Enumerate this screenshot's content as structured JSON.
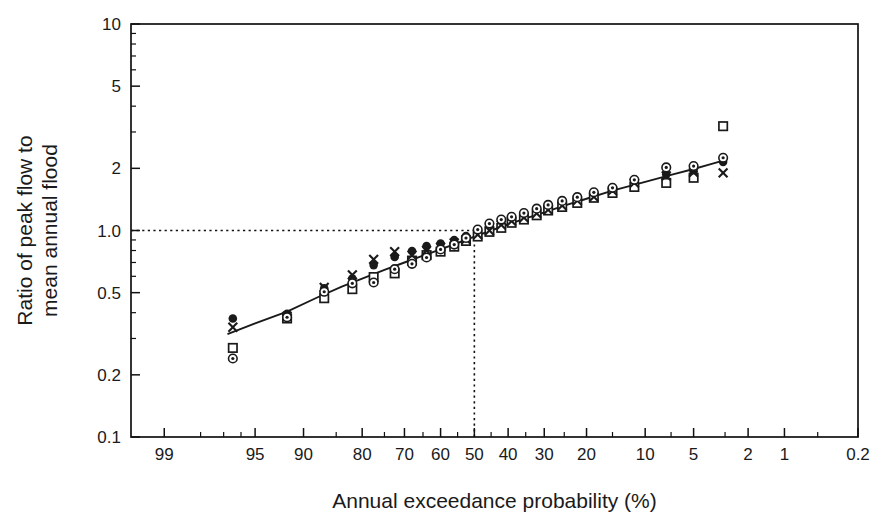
{
  "chart_data": {
    "type": "scatter",
    "title": "",
    "xlabel": "Annual exceedance probability (%)",
    "ylabel_line1": "Ratio of peak flow to",
    "ylabel_line2": "mean annual flood",
    "x_scale": "probability",
    "y_scale": "log",
    "xlim": [
      99.5,
      0.2
    ],
    "ylim": [
      0.1,
      10
    ],
    "grid": false,
    "legend": "none",
    "x_tick_labels": [
      "99",
      "95",
      "90",
      "80",
      "70",
      "60",
      "50",
      "40",
      "30",
      "20",
      "10",
      "5",
      "2",
      "1",
      "0.2"
    ],
    "x_tick_values": [
      99,
      95,
      90,
      80,
      70,
      60,
      50,
      40,
      30,
      20,
      10,
      5,
      2,
      1,
      0.2
    ],
    "x_minor_ticks": [
      98,
      97,
      96,
      85,
      75,
      65,
      55,
      45,
      35,
      25,
      15,
      7,
      3,
      0.5
    ],
    "y_tick_labels": [
      "0.1",
      "0.2",
      "0.5",
      "1.0",
      "2",
      "5",
      "10"
    ],
    "y_tick_values": [
      0.1,
      0.2,
      0.5,
      1.0,
      2,
      5,
      10
    ],
    "y_minor_ticks": [
      0.3,
      0.4,
      0.6,
      0.7,
      0.8,
      0.9,
      3,
      4,
      6,
      7,
      8,
      9
    ],
    "reference_lines": [
      {
        "name": "horizontal-ratio-one",
        "orientation": "horizontal",
        "value": 1.0,
        "style": "dotted",
        "from_x": 99.5,
        "to_x": 50
      },
      {
        "name": "vertical-fifty-percent",
        "orientation": "vertical",
        "value": 50,
        "style": "dotted",
        "from_y": 0.1,
        "to_y": 1.0
      }
    ],
    "fit_curve": {
      "name": "fitted-frequency-curve",
      "style": "solid",
      "points": [
        {
          "x": 96.8,
          "y": 0.315
        },
        {
          "x": 95.0,
          "y": 0.355
        },
        {
          "x": 92.0,
          "y": 0.405
        },
        {
          "x": 88.0,
          "y": 0.475
        },
        {
          "x": 84.0,
          "y": 0.535
        },
        {
          "x": 80.0,
          "y": 0.585
        },
        {
          "x": 75.0,
          "y": 0.645
        },
        {
          "x": 70.0,
          "y": 0.7
        },
        {
          "x": 65.0,
          "y": 0.755
        },
        {
          "x": 60.0,
          "y": 0.81
        },
        {
          "x": 55.0,
          "y": 0.87
        },
        {
          "x": 50.0,
          "y": 0.935
        },
        {
          "x": 45.0,
          "y": 1.0
        },
        {
          "x": 40.0,
          "y": 1.07
        },
        {
          "x": 35.0,
          "y": 1.145
        },
        {
          "x": 30.0,
          "y": 1.225
        },
        {
          "x": 25.0,
          "y": 1.32
        },
        {
          "x": 20.0,
          "y": 1.425
        },
        {
          "x": 15.0,
          "y": 1.56
        },
        {
          "x": 10.0,
          "y": 1.72
        },
        {
          "x": 7.0,
          "y": 1.86
        },
        {
          "x": 5.0,
          "y": 1.985
        },
        {
          "x": 3.8,
          "y": 2.095
        },
        {
          "x": 3.1,
          "y": 2.18
        }
      ]
    },
    "series": [
      {
        "name": "filled-circle-series",
        "marker": "filled-circle",
        "points": [
          {
            "x": 96.5,
            "y": 0.375
          },
          {
            "x": 92.0,
            "y": 0.395
          },
          {
            "x": 87.0,
            "y": 0.525
          },
          {
            "x": 82.0,
            "y": 0.585
          },
          {
            "x": 77.5,
            "y": 0.68
          },
          {
            "x": 72.5,
            "y": 0.745
          },
          {
            "x": 68.0,
            "y": 0.795
          },
          {
            "x": 64.0,
            "y": 0.84
          },
          {
            "x": 60.0,
            "y": 0.865
          },
          {
            "x": 56.0,
            "y": 0.9
          },
          {
            "x": 52.5,
            "y": 0.94
          },
          {
            "x": 49.0,
            "y": 0.985
          },
          {
            "x": 45.5,
            "y": 1.04
          },
          {
            "x": 42.0,
            "y": 1.085
          },
          {
            "x": 39.0,
            "y": 1.12
          },
          {
            "x": 35.5,
            "y": 1.165
          },
          {
            "x": 32.0,
            "y": 1.225
          },
          {
            "x": 29.0,
            "y": 1.27
          },
          {
            "x": 25.5,
            "y": 1.33
          },
          {
            "x": 22.0,
            "y": 1.4
          },
          {
            "x": 18.5,
            "y": 1.465
          },
          {
            "x": 15.0,
            "y": 1.545
          },
          {
            "x": 11.5,
            "y": 1.64
          },
          {
            "x": 7.5,
            "y": 1.87
          },
          {
            "x": 5.0,
            "y": 1.935
          },
          {
            "x": 3.1,
            "y": 2.15
          }
        ]
      },
      {
        "name": "open-square-series",
        "marker": "open-square",
        "points": [
          {
            "x": 96.5,
            "y": 0.27
          },
          {
            "x": 92.0,
            "y": 0.375
          },
          {
            "x": 87.0,
            "y": 0.47
          },
          {
            "x": 82.0,
            "y": 0.52
          },
          {
            "x": 77.5,
            "y": 0.595
          },
          {
            "x": 72.5,
            "y": 0.62
          },
          {
            "x": 68.0,
            "y": 0.715
          },
          {
            "x": 64.0,
            "y": 0.76
          },
          {
            "x": 60.0,
            "y": 0.79
          },
          {
            "x": 56.0,
            "y": 0.835
          },
          {
            "x": 52.5,
            "y": 0.89
          },
          {
            "x": 49.0,
            "y": 0.935
          },
          {
            "x": 45.5,
            "y": 0.985
          },
          {
            "x": 42.0,
            "y": 1.03
          },
          {
            "x": 39.0,
            "y": 1.09
          },
          {
            "x": 35.5,
            "y": 1.13
          },
          {
            "x": 32.0,
            "y": 1.185
          },
          {
            "x": 29.0,
            "y": 1.25
          },
          {
            "x": 25.5,
            "y": 1.3
          },
          {
            "x": 22.0,
            "y": 1.36
          },
          {
            "x": 18.5,
            "y": 1.44
          },
          {
            "x": 15.0,
            "y": 1.52
          },
          {
            "x": 11.5,
            "y": 1.625
          },
          {
            "x": 7.5,
            "y": 1.7
          },
          {
            "x": 5.0,
            "y": 1.8
          },
          {
            "x": 3.1,
            "y": 3.2
          }
        ]
      },
      {
        "name": "cross-series",
        "marker": "cross",
        "points": [
          {
            "x": 96.5,
            "y": 0.34
          },
          {
            "x": 92.0,
            "y": 0.385
          },
          {
            "x": 87.0,
            "y": 0.53
          },
          {
            "x": 82.0,
            "y": 0.61
          },
          {
            "x": 77.5,
            "y": 0.725
          },
          {
            "x": 72.5,
            "y": 0.79
          },
          {
            "x": 68.0,
            "y": 0.76
          },
          {
            "x": 64.0,
            "y": 0.8
          },
          {
            "x": 60.0,
            "y": 0.83
          },
          {
            "x": 56.0,
            "y": 0.87
          },
          {
            "x": 52.5,
            "y": 0.905
          },
          {
            "x": 49.0,
            "y": 0.955
          },
          {
            "x": 45.5,
            "y": 1.0
          },
          {
            "x": 42.0,
            "y": 1.065
          },
          {
            "x": 39.0,
            "y": 1.11
          },
          {
            "x": 35.5,
            "y": 1.155
          },
          {
            "x": 32.0,
            "y": 1.21
          },
          {
            "x": 29.0,
            "y": 1.26
          },
          {
            "x": 25.5,
            "y": 1.32
          },
          {
            "x": 22.0,
            "y": 1.395
          },
          {
            "x": 18.5,
            "y": 1.455
          },
          {
            "x": 15.0,
            "y": 1.56
          },
          {
            "x": 11.5,
            "y": 1.7
          },
          {
            "x": 7.5,
            "y": 1.84
          },
          {
            "x": 5.0,
            "y": 1.91
          },
          {
            "x": 3.1,
            "y": 1.9
          }
        ]
      },
      {
        "name": "dotted-circle-series",
        "marker": "circle-with-dot",
        "points": [
          {
            "x": 96.5,
            "y": 0.24
          },
          {
            "x": 92.0,
            "y": 0.38
          },
          {
            "x": 87.0,
            "y": 0.505
          },
          {
            "x": 82.0,
            "y": 0.555
          },
          {
            "x": 77.5,
            "y": 0.56
          },
          {
            "x": 72.5,
            "y": 0.65
          },
          {
            "x": 68.0,
            "y": 0.69
          },
          {
            "x": 64.0,
            "y": 0.74
          },
          {
            "x": 60.0,
            "y": 0.81
          },
          {
            "x": 56.0,
            "y": 0.855
          },
          {
            "x": 52.5,
            "y": 0.92
          },
          {
            "x": 49.0,
            "y": 1.01
          },
          {
            "x": 45.5,
            "y": 1.08
          },
          {
            "x": 42.0,
            "y": 1.13
          },
          {
            "x": 39.0,
            "y": 1.165
          },
          {
            "x": 35.5,
            "y": 1.215
          },
          {
            "x": 32.0,
            "y": 1.275
          },
          {
            "x": 29.0,
            "y": 1.33
          },
          {
            "x": 25.5,
            "y": 1.39
          },
          {
            "x": 22.0,
            "y": 1.45
          },
          {
            "x": 18.5,
            "y": 1.53
          },
          {
            "x": 15.0,
            "y": 1.61
          },
          {
            "x": 11.5,
            "y": 1.76
          },
          {
            "x": 7.5,
            "y": 2.02
          },
          {
            "x": 5.0,
            "y": 2.05
          },
          {
            "x": 3.1,
            "y": 2.25
          }
        ]
      }
    ]
  }
}
